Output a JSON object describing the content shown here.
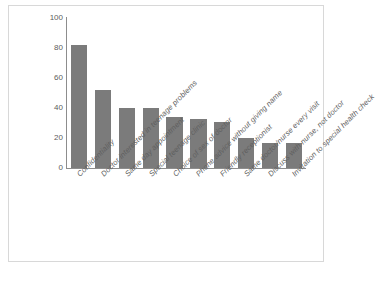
{
  "chart_data": {
    "type": "bar",
    "title": "",
    "xlabel": "",
    "ylabel": "Percentage",
    "ylim": [
      0,
      100
    ],
    "yticks": [
      0,
      20,
      40,
      60,
      80,
      100
    ],
    "grid": false,
    "legend": "none",
    "bar_color": "#7b7b7b",
    "categories": [
      "Confidentiality",
      "Doctor interested in teenage problems",
      "Same day appointment",
      "Special teenage clinic",
      "Choice of sex of doctor",
      "Phone advice without giving name",
      "Friendly receptionist",
      "Same doctor/nurse every visit",
      "Discuss with nurse, not doctor",
      "Invitation to special health check"
    ],
    "values": [
      82,
      52,
      40,
      40,
      34,
      33,
      31,
      20,
      17,
      17
    ]
  },
  "caption": ""
}
